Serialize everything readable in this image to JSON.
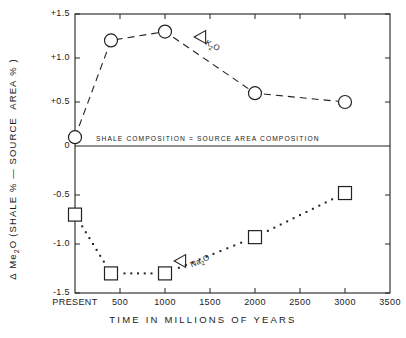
{
  "chart_data": {
    "type": "line",
    "title": "",
    "xlabel": "TIME IN MILLIONS OF YEARS",
    "ylabel_parts": {
      "delta": "Δ",
      "main": "Me",
      "sub": "2",
      "rest": "O (SHALE %  —  SOURCE  AREA %  )"
    },
    "ylabel_full": "Δ Me2O (SHALE % — SOURCE AREA %)",
    "xlim": [
      0,
      3500
    ],
    "ylim": [
      -1.5,
      1.5
    ],
    "grid": false,
    "legend_position": "inline-annotation",
    "zero_line_label": "SHALE  COMPOSITION  =  SOURCE  AREA  COMPOSITION",
    "xticks": [
      {
        "value": 0,
        "label": "PRESENT"
      },
      {
        "value": 500,
        "label": "500"
      },
      {
        "value": 1000,
        "label": "1000"
      },
      {
        "value": 1500,
        "label": "1500"
      },
      {
        "value": 2000,
        "label": "2000"
      },
      {
        "value": 2500,
        "label": "2500"
      },
      {
        "value": 3000,
        "label": "3000"
      },
      {
        "value": 3500,
        "label": "3500"
      }
    ],
    "yticks": [
      {
        "value": 1.5,
        "label": "+1.5"
      },
      {
        "value": 1.0,
        "label": "+1.0"
      },
      {
        "value": 0.5,
        "label": "+0.5"
      },
      {
        "value": 0.0,
        "label": "0"
      },
      {
        "value": -0.5,
        "label": "-0.5"
      },
      {
        "value": -1.0,
        "label": "-1.0"
      },
      {
        "value": -1.5,
        "label": "-1.5"
      }
    ],
    "series": [
      {
        "name": "Δ K2O",
        "annotation": "K",
        "annotation_sub": "2",
        "annotation_rest": "O",
        "marker": "circle",
        "linestyle": "dashed",
        "x": [
          0,
          400,
          1000,
          2000,
          3000
        ],
        "values": [
          0.1,
          1.2,
          1.3,
          0.6,
          0.5
        ]
      },
      {
        "name": "Δ Na2O",
        "annotation": "Na",
        "annotation_sub": "2",
        "annotation_rest": "O",
        "marker": "square",
        "linestyle": "dotted",
        "x": [
          0,
          400,
          1000,
          2000,
          3000
        ],
        "values": [
          -0.7,
          -1.3,
          -1.3,
          -0.93,
          -0.48
        ]
      }
    ]
  }
}
